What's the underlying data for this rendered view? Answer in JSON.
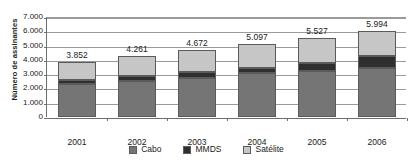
{
  "chart_data": {
    "type": "bar",
    "subtype": "stacked-column",
    "title": "",
    "xlabel": "",
    "ylabel": "Número de assinantes",
    "categories": [
      "2001",
      "2002",
      "2003",
      "2004",
      "2005",
      "2006"
    ],
    "series": [
      {
        "name": "Cabo",
        "color": "#757575",
        "values": [
          2310,
          2520,
          2730,
          3080,
          3220,
          3430
        ]
      },
      {
        "name": "MMDS",
        "color": "#2f2f2f",
        "values": [
          280,
          350,
          420,
          350,
          560,
          840
        ]
      },
      {
        "name": "Satélite",
        "color": "#c6c6c6",
        "values": [
          1262,
          1391,
          1522,
          1667,
          1747,
          1724
        ]
      }
    ],
    "totals": [
      3852,
      4261,
      4672,
      5097,
      5527,
      5994
    ],
    "total_labels": [
      "3.852",
      "4.261",
      "4.672",
      "5.097",
      "5.527",
      "5.994"
    ],
    "ylim": [
      0,
      7000
    ],
    "ytick_values": [
      0,
      1000,
      2000,
      3000,
      4000,
      5000,
      6000,
      7000
    ],
    "ytick_labels": [
      "0",
      "1.000",
      "2.000",
      "3.000",
      "4.000",
      "5.000",
      "6.000",
      "7.000"
    ],
    "grid": true,
    "grid_axis": "y",
    "legend_position": "bottom",
    "legend": [
      "Cabo",
      "MMDS",
      "Satélite"
    ]
  }
}
